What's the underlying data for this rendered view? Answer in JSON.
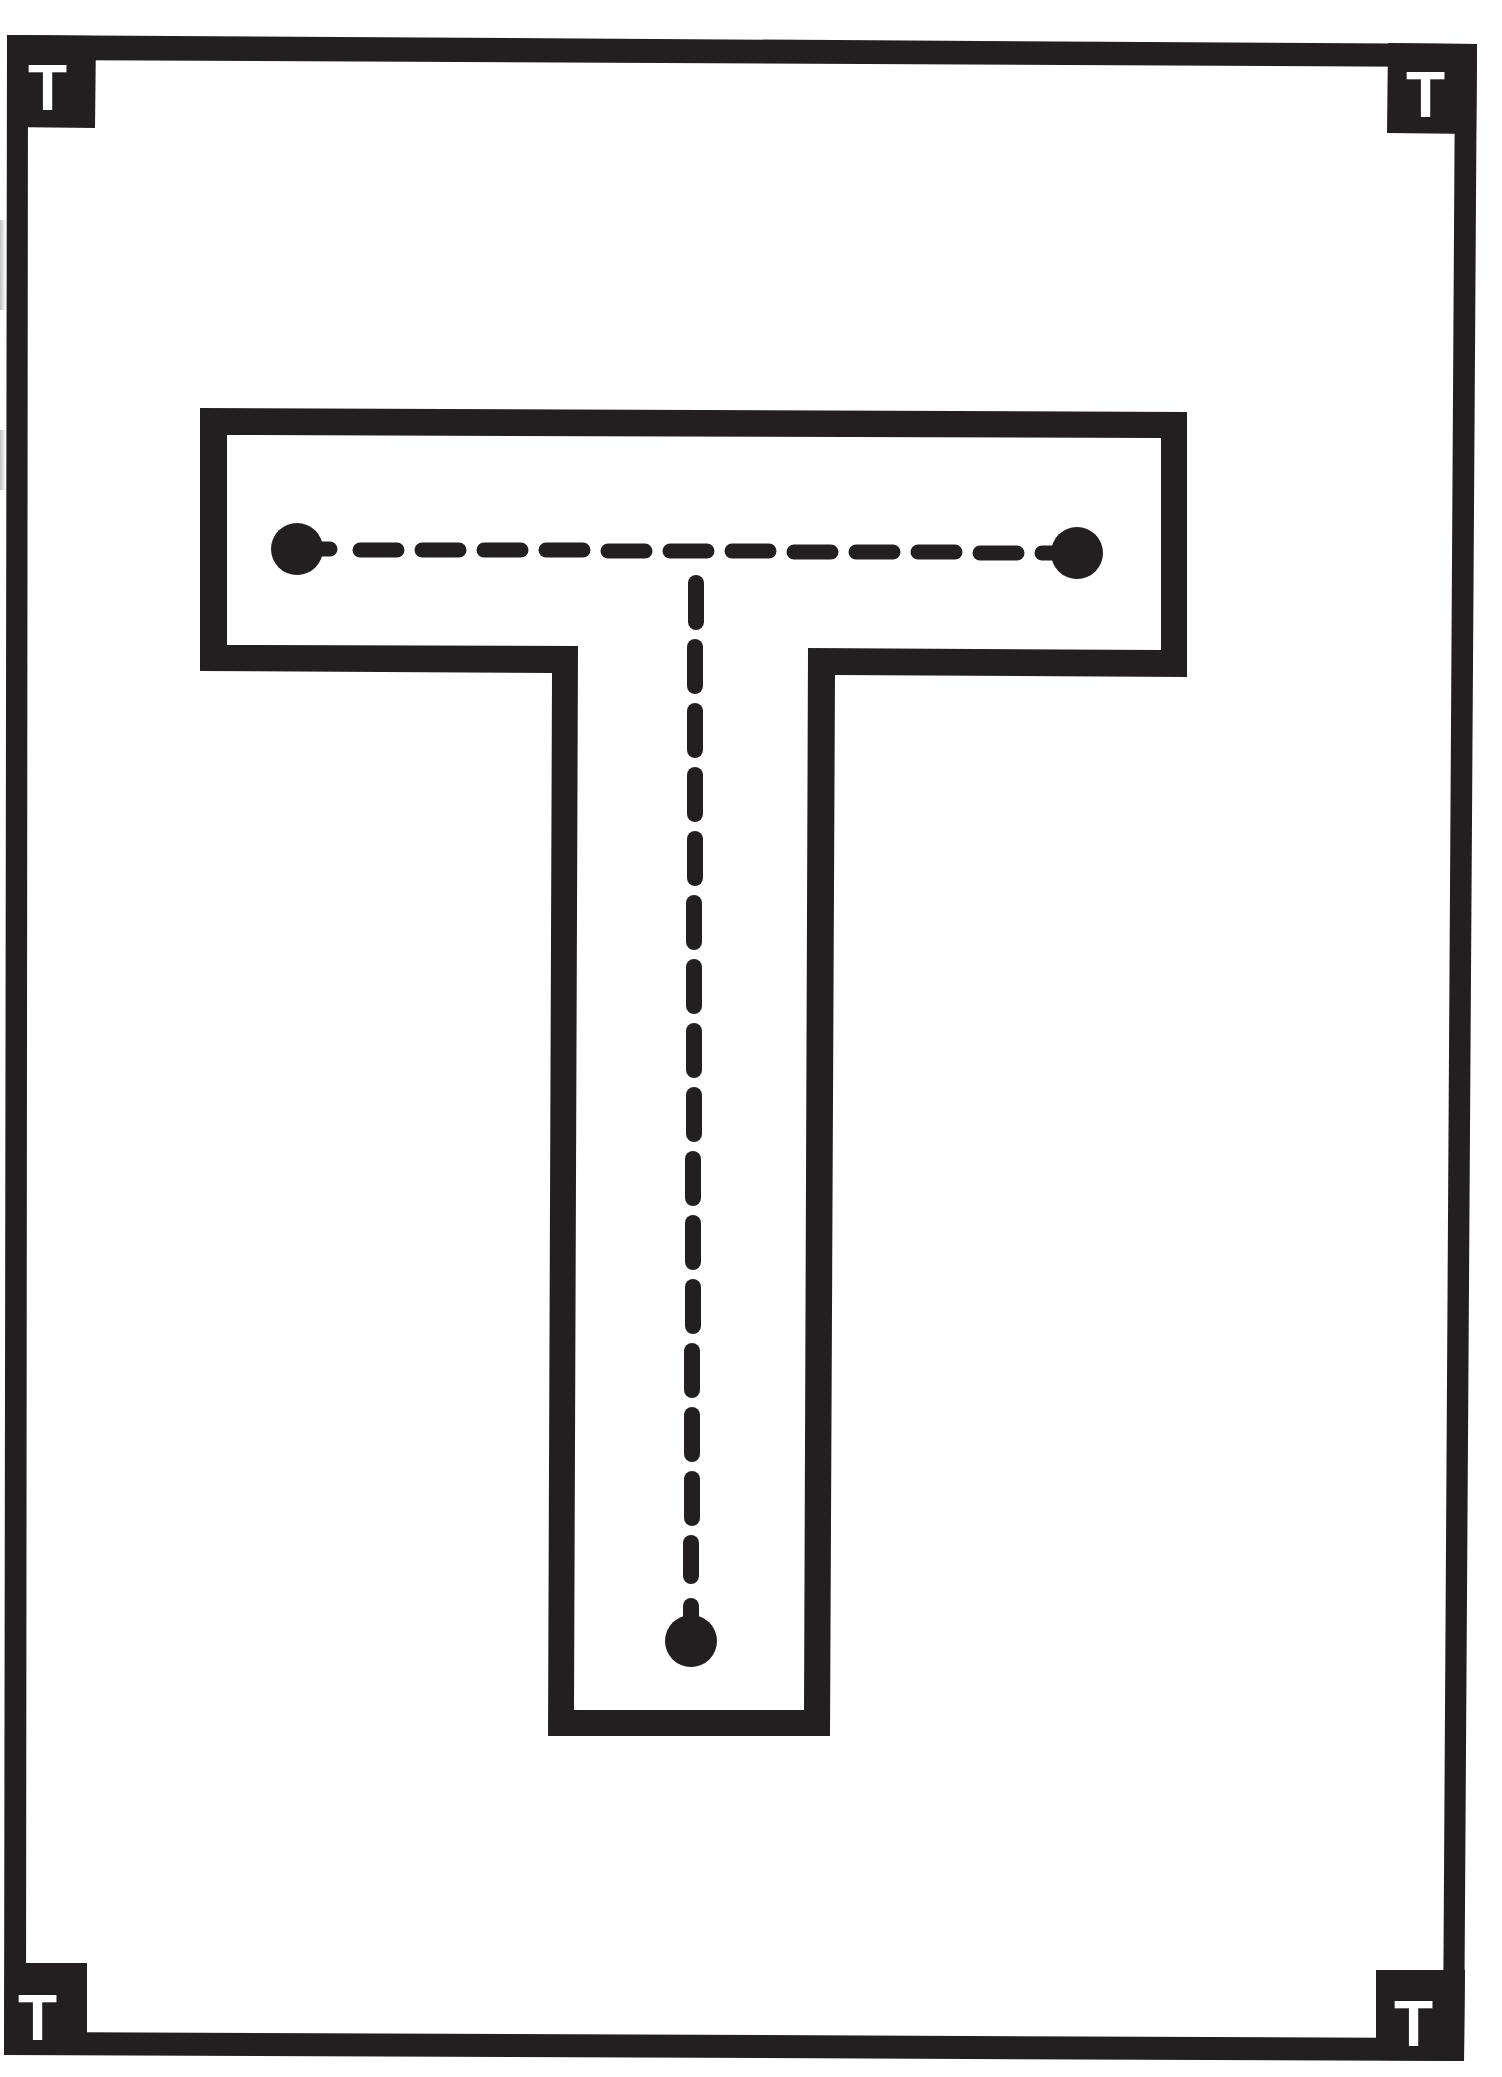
{
  "worksheet": {
    "type": "letter tracing worksheet",
    "letter": "T",
    "colors": {
      "ink": "#231f20",
      "paper": "#ffffff",
      "badge_text": "#ffffff"
    },
    "corner_badges": [
      {
        "position": "top-left",
        "label": "T"
      },
      {
        "position": "top-right",
        "label": "T"
      },
      {
        "position": "bottom-left",
        "label": "T"
      },
      {
        "position": "bottom-right",
        "label": "T"
      }
    ],
    "tracing_strokes": [
      {
        "order": 1,
        "direction": "horizontal",
        "description": "left to right across the top bar"
      },
      {
        "order": 2,
        "direction": "vertical",
        "description": "top to bottom down the stem"
      }
    ],
    "start_dots": 3
  }
}
